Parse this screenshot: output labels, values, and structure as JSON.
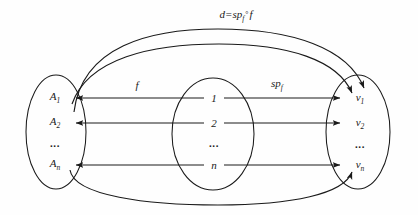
{
  "figure": {
    "kind": "commutative-set-mapping-diagram",
    "background_color": "#fefefe",
    "ink_color": "#1a1a1a",
    "top_label": {
      "full_text": "d=sp_f ° f",
      "lhs": "d=",
      "map_name": "sp",
      "map_subscript": "f",
      "composition_operator": "°",
      "rhs": "f"
    },
    "edge_labels": {
      "f": {
        "text": "f"
      },
      "spf": {
        "base": "sp",
        "subscript": "f"
      }
    },
    "sets": {
      "left": {
        "name": "A-set",
        "items": [
          {
            "base": "A",
            "subscript": "1"
          },
          {
            "base": "A",
            "subscript": "2"
          },
          {
            "base": "…",
            "subscript": ""
          },
          {
            "base": "A",
            "subscript": "n"
          }
        ],
        "ellipsis": "..."
      },
      "middle": {
        "name": "index-set",
        "items": [
          {
            "base": "1",
            "subscript": ""
          },
          {
            "base": "2",
            "subscript": ""
          },
          {
            "base": "…",
            "subscript": ""
          },
          {
            "base": "n",
            "subscript": ""
          }
        ],
        "ellipsis": "..."
      },
      "right": {
        "name": "v-set",
        "items": [
          {
            "base": "v",
            "subscript": "1"
          },
          {
            "base": "v",
            "subscript": "2"
          },
          {
            "base": "…",
            "subscript": ""
          },
          {
            "base": "v",
            "subscript": "n"
          }
        ],
        "ellipsis": "..."
      }
    }
  }
}
